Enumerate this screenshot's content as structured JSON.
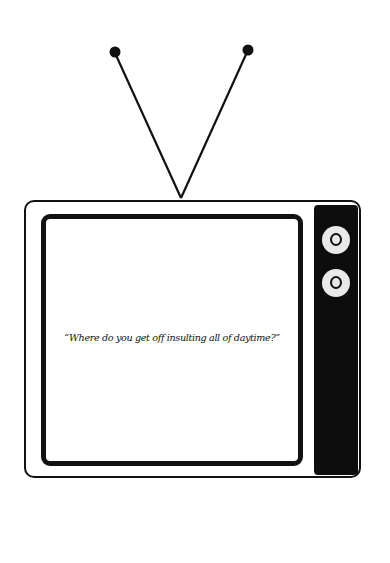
{
  "illustration": {
    "subject": "retro television with antenna",
    "screen_quote": "“Where do you get off insulting all of daytime?”",
    "colors": {
      "background": "#ffffff",
      "ink": "#111111",
      "knob": "#e9e9e9"
    },
    "icons": {
      "antenna": "antenna-icon",
      "knob_top": "dial-knob-icon",
      "knob_bottom": "dial-knob-icon"
    }
  }
}
